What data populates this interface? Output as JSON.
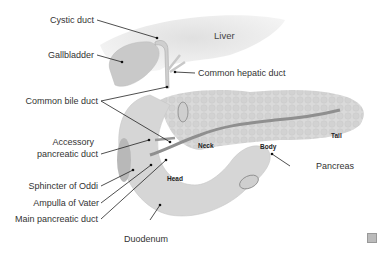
{
  "diagram": {
    "organs": {
      "liver": "Liver",
      "neck": "Neck",
      "body": "Body",
      "tail": "Tail",
      "head": "Head"
    },
    "labels": {
      "cystic_duct": "Cystic duct",
      "gallbladder": "Gallbladder",
      "common_hepatic_duct": "Common hepatic duct",
      "common_bile_duct": "Common bile duct",
      "accessory_pancreatic_duct_1": "Accessory",
      "accessory_pancreatic_duct_2": "pancreatic duct",
      "sphincter_of_oddi": "Sphincter of Oddi",
      "ampulla_of_vater": "Ampulla of Vater",
      "main_pancreatic_duct": "Main pancreatic duct",
      "duodenum": "Duodenum",
      "pancreas": "Pancreas"
    },
    "colors": {
      "organ_fill": "#d9d9d9",
      "duct_fill": "#a8a8a8",
      "leader_line": "#222222",
      "text": "#333333"
    },
    "expand_icon": "expand-icon"
  }
}
